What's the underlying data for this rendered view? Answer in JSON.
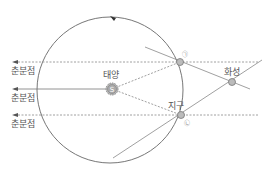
{
  "diagram": {
    "labels": {
      "vernal_equinox_top": "춘분점",
      "vernal_equinox_middle": "춘분점",
      "vernal_equinox_bottom": "춘분점",
      "sun": "태양",
      "sun_symbol": "S",
      "earth": "지구",
      "mars": "화성",
      "marker_a": "㉠",
      "marker_b": "㉡"
    },
    "colors": {
      "line": "#777777",
      "dashed": "#888888",
      "body_fill": "#bbbbbb"
    }
  }
}
